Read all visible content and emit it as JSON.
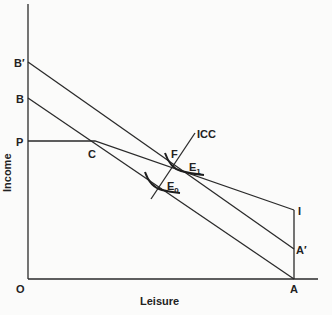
{
  "diagram": {
    "axes": {
      "y_label": "Income",
      "x_label": "Leisure",
      "origin_label": "O"
    },
    "points": {
      "B_prime": "B′",
      "B": "B",
      "P": "P",
      "C": "C",
      "F": "F",
      "E1": "E",
      "E1_sub": "1",
      "E0": "E",
      "E0_sub": "0",
      "I": "I",
      "A_prime": "A′",
      "A": "A"
    },
    "curves": {
      "icc_label": "ICC"
    },
    "lines": [
      {
        "name": "budget-line-B-A",
        "from": "B",
        "to": "A"
      },
      {
        "name": "budget-line-Bprime-Aprime",
        "from": "B′",
        "to": "A′"
      },
      {
        "name": "kinked-line-P-C-I",
        "points": [
          "P",
          "C",
          "I"
        ]
      },
      {
        "name": "vertical-line-A-I",
        "from": "A",
        "to": "I"
      },
      {
        "name": "income-consumption-curve",
        "label": "ICC"
      }
    ]
  }
}
